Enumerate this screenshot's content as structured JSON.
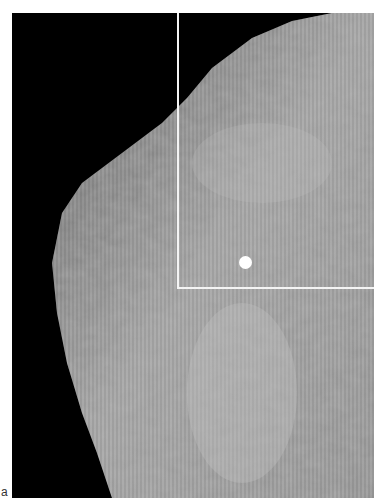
{
  "figure": {
    "panel_label": "a",
    "image_type": "mammogram",
    "annotations": {
      "region_of_interest": "rectangle outline (upper right)",
      "marker": "white dot"
    },
    "colors": {
      "background": "#000000",
      "tissue": "#a8a8a8",
      "annotation": "#ffffff"
    }
  }
}
